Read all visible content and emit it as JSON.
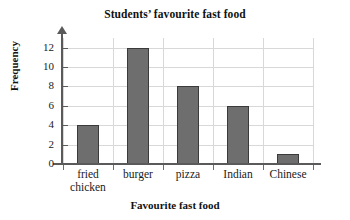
{
  "chart_data": {
    "type": "bar",
    "title": "Students’ favourite fast food",
    "xlabel": "Favourite fast food",
    "ylabel": "Frequency",
    "categories": [
      "fried chicken",
      "burger",
      "pizza",
      "Indian",
      "Chinese"
    ],
    "category_lines": [
      [
        "fried",
        "chicken"
      ],
      [
        "burger"
      ],
      [
        "pizza"
      ],
      [
        "Indian"
      ],
      [
        "Chinese"
      ]
    ],
    "values": [
      4,
      12,
      8,
      6,
      1
    ],
    "ylim": [
      0,
      13
    ],
    "yticks": [
      0,
      2,
      4,
      6,
      8,
      10,
      12
    ],
    "ytick_labels": [
      "0",
      "2",
      "4",
      "6",
      "8",
      "10",
      "12"
    ],
    "grid": true,
    "legend": false,
    "bar_color": "#6e6e6e",
    "bar_edge_color": "#3a3a3a",
    "grid_color": "#d8d8d8",
    "axis_color": "#5a5a5a",
    "y_axis_has_arrow": true
  }
}
